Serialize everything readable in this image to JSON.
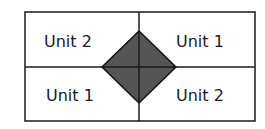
{
  "diagram": {
    "cells": [
      {
        "position": "top-left",
        "label": "Unit 2"
      },
      {
        "position": "top-right",
        "label": "Unit 1"
      },
      {
        "position": "bottom-left",
        "label": "Unit 1"
      },
      {
        "position": "bottom-right",
        "label": "Unit 2"
      }
    ],
    "center_shape": {
      "type": "diamond",
      "fill": "#555555"
    },
    "line_color": "#1a1a1a",
    "background": "#ffffff"
  }
}
